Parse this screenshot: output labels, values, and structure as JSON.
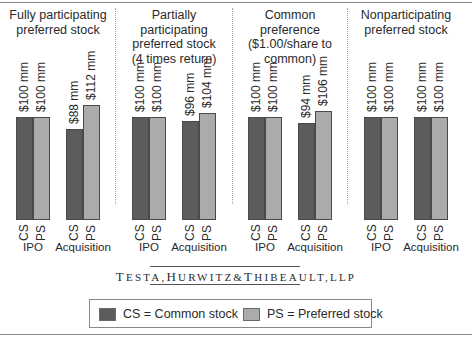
{
  "chart_data": {
    "type": "bar",
    "title": "",
    "xlabel": "",
    "ylabel": "",
    "ylim": [
      0,
      112
    ],
    "grid": false,
    "legend_position": "bottom",
    "panels": [
      {
        "title": "Fully participating preferred stock",
        "title_lines": [
          "Fully participating",
          "preferred stock"
        ],
        "categories": [
          "IPO",
          "Acquisition"
        ],
        "series": [
          {
            "name": "CS",
            "values": [
              100,
              88
            ]
          },
          {
            "name": "PS",
            "values": [
              100,
              112
            ]
          }
        ],
        "labels": [
          [
            "$100 mm",
            "$100 mm"
          ],
          [
            "$88 mm",
            "$112 mm"
          ]
        ]
      },
      {
        "title": "Partially participating preferred stock (4 times return)",
        "title_lines": [
          "Partially participating",
          "preferred stock",
          "(4 times return)"
        ],
        "categories": [
          "IPO",
          "Acquisition"
        ],
        "series": [
          {
            "name": "CS",
            "values": [
              100,
              96
            ]
          },
          {
            "name": "PS",
            "values": [
              100,
              104
            ]
          }
        ],
        "labels": [
          [
            "$100 mm",
            "$100 mm"
          ],
          [
            "$96 mm",
            "$104 mm"
          ]
        ]
      },
      {
        "title": "Common preference ($1.00/share to common)",
        "title_lines": [
          "Common preference",
          "($1.00/share to",
          "common)"
        ],
        "categories": [
          "IPO",
          "Acquisition"
        ],
        "series": [
          {
            "name": "CS",
            "values": [
              100,
              94
            ]
          },
          {
            "name": "PS",
            "values": [
              100,
              106
            ]
          }
        ],
        "labels": [
          [
            "$100 mm",
            "$100 mm"
          ],
          [
            "$94 mm",
            "$106 mm"
          ]
        ]
      },
      {
        "title": "Nonparticipating preferred stock",
        "title_lines": [
          "Nonparticipating",
          "preferred stock"
        ],
        "categories": [
          "IPO",
          "Acquisition"
        ],
        "series": [
          {
            "name": "CS",
            "values": [
              100,
              100
            ]
          },
          {
            "name": "PS",
            "values": [
              100,
              100
            ]
          }
        ],
        "labels": [
          [
            "$100 mm",
            "$100 mm"
          ],
          [
            "$100 mm",
            "$100 mm"
          ]
        ]
      }
    ],
    "legend": [
      {
        "key": "CS",
        "label": "CS = Common stock",
        "color": "#5c5c5c"
      },
      {
        "key": "PS",
        "label": "PS = Preferred stock",
        "color": "#ababab"
      }
    ]
  },
  "bar_axis_labels": {
    "cs": "CS",
    "ps": "PS"
  },
  "logo": {
    "text": "TESTA, HURWITZ & THIBEAULT, LLP",
    "parts": [
      "T",
      "ESTA",
      ",",
      "H",
      "URWITZ",
      "&",
      "T",
      "HIBEAULT",
      ",",
      "LLP"
    ]
  },
  "legend": {
    "cs_label": "CS = Common stock",
    "ps_label": "PS = Preferred stock"
  },
  "colors": {
    "cs": "#5c5c5c",
    "ps": "#ababab",
    "border": "#4a4a4a"
  }
}
